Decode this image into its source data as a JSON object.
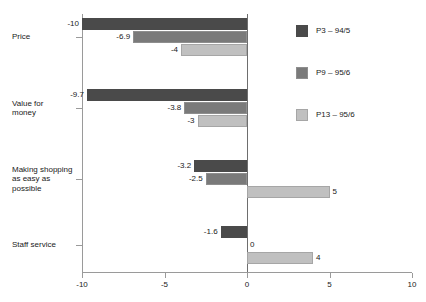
{
  "chart_data": {
    "type": "bar",
    "orientation": "horizontal",
    "title": "",
    "xlabel": "",
    "ylabel": "",
    "xlim": [
      -10,
      10
    ],
    "xticks": [
      -10,
      -5,
      0,
      5,
      10
    ],
    "xtick_labels": [
      "-10",
      "-5",
      "0",
      "5",
      "10"
    ],
    "grid": false,
    "legend_position": "right",
    "categories": [
      "Price",
      "Value for money",
      "Making shopping as easy as possible",
      "Staff service"
    ],
    "category_lines": [
      [
        "Price"
      ],
      [
        "Value for",
        "money"
      ],
      [
        "Making shopping",
        "as easy as",
        "possible"
      ],
      [
        "Staff service"
      ]
    ],
    "series": [
      {
        "name": "P3 – 94/5",
        "color": "#4a4a4a",
        "values": [
          -10,
          -9.7,
          -3.2,
          -1.6
        ],
        "labels": [
          "-10",
          "-9.7",
          "-3.2",
          "-1.6"
        ]
      },
      {
        "name": "P9 – 95/6",
        "color": "#7a7a7a",
        "values": [
          -6.9,
          -3.8,
          -2.5,
          0
        ],
        "labels": [
          "-6.9",
          "-3.8",
          "-2.5",
          "0"
        ]
      },
      {
        "name": "P13 – 95/6",
        "color": "#c0c0c0",
        "values": [
          -4,
          -3,
          5,
          4
        ],
        "labels": [
          "-4",
          "-3",
          "5",
          "4"
        ]
      }
    ]
  },
  "legend": {
    "entries": [
      {
        "label": "P3 – 94/5",
        "color": "#4a4a4a"
      },
      {
        "label": "P9 – 95/6",
        "color": "#7a7a7a"
      },
      {
        "label": "P13 – 95/6",
        "color": "#c0c0c0"
      }
    ]
  },
  "caption": ""
}
